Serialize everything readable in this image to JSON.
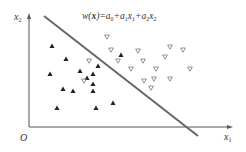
{
  "diagram": {
    "title_formula": {
      "w": "w",
      "x_bold": "x",
      "parts": [
        "w(",
        "x",
        ")=",
        "a",
        "0",
        "+",
        "a",
        "1",
        "x",
        "1",
        "+",
        "a",
        "2",
        "x",
        "2"
      ]
    },
    "axes": {
      "origin_label": "O",
      "x_label": "x",
      "x_label_sub": "1",
      "y_label": "x",
      "y_label_sub": "2"
    },
    "decision_line": {
      "x1": 44,
      "y1": 16,
      "x2": 198,
      "y2": 136,
      "color": "#666666"
    },
    "colors": {
      "axis": "#555555",
      "filled": "#222222",
      "open_stroke": "#777777"
    },
    "class_filled_triangles": [
      [
        52,
        46
      ],
      [
        66,
        59
      ],
      [
        50,
        74
      ],
      [
        80,
        71
      ],
      [
        98,
        66
      ],
      [
        93,
        74
      ],
      [
        87,
        78
      ],
      [
        93,
        84
      ],
      [
        63,
        89
      ],
      [
        73,
        91
      ],
      [
        93,
        91
      ],
      [
        57,
        108
      ],
      [
        96,
        108
      ],
      [
        113,
        103
      ],
      [
        121,
        55
      ]
    ],
    "class_open_triangles_down": [
      [
        107,
        37
      ],
      [
        111,
        50
      ],
      [
        89,
        61
      ],
      [
        118,
        61
      ],
      [
        138,
        51
      ],
      [
        143,
        61
      ],
      [
        131,
        69
      ],
      [
        156,
        69
      ],
      [
        165,
        57
      ],
      [
        170,
        47
      ],
      [
        183,
        50
      ],
      [
        190,
        69
      ],
      [
        144,
        81
      ],
      [
        154,
        79
      ],
      [
        151,
        88
      ],
      [
        170,
        79
      ],
      [
        84,
        81
      ]
    ]
  }
}
